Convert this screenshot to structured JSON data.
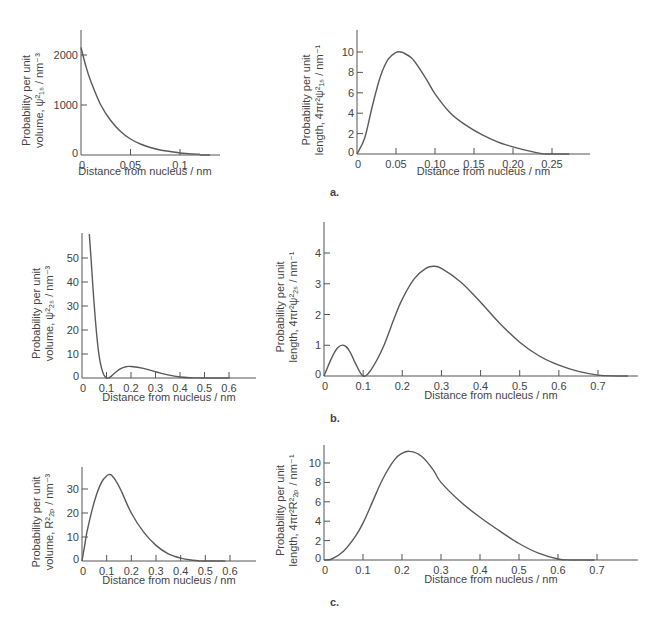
{
  "chart_data": [
    {
      "id": "a-left",
      "type": "line",
      "title": "",
      "xlabel": "Distance from nucleus / nm",
      "ylabel_line1": "Probability per unit",
      "ylabel_line2": "volume, ψ²₁ₛ / nm⁻³",
      "xlim": [
        0,
        0.13
      ],
      "ylim": [
        0,
        2500
      ],
      "xticks": [
        0,
        0.05,
        0.1
      ],
      "xtick_labels": [
        "0",
        "0.05",
        "0.1"
      ],
      "yticks": [
        0,
        1000,
        2000
      ],
      "ytick_labels": [
        "0",
        "1000",
        "2000"
      ],
      "x": [
        0,
        0.005,
        0.01,
        0.02,
        0.03,
        0.04,
        0.05,
        0.06,
        0.07,
        0.08,
        0.09,
        0.1,
        0.11,
        0.12
      ],
      "values": [
        2150,
        1770,
        1470,
        1000,
        690,
        470,
        320,
        220,
        150,
        100,
        70,
        40,
        25,
        15
      ]
    },
    {
      "id": "a-right",
      "type": "line",
      "title": "",
      "xlabel": "Distance from nucleus / nm",
      "ylabel_line1": "Probability per unit",
      "ylabel_line2": "length, 4πr²ψ²₁ₛ / nm⁻¹",
      "xlim": [
        0,
        0.28
      ],
      "ylim": [
        0,
        12
      ],
      "xticks": [
        0,
        0.05,
        0.1,
        0.15,
        0.2,
        0.25
      ],
      "xtick_labels": [
        "0",
        "0.05",
        "0.10",
        "0.15",
        "0.20",
        "0.25"
      ],
      "yticks": [
        0,
        2,
        4,
        6,
        8,
        10
      ],
      "ytick_labels": [
        "0",
        "2",
        "4",
        "6",
        "8",
        "10"
      ],
      "x": [
        0,
        0.01,
        0.02,
        0.03,
        0.04,
        0.05,
        0.055,
        0.06,
        0.07,
        0.08,
        0.09,
        0.1,
        0.12,
        0.14,
        0.16,
        0.18,
        0.2,
        0.22,
        0.24
      ],
      "values": [
        0,
        1.6,
        4.8,
        7.6,
        9.3,
        9.95,
        10.0,
        9.9,
        9.4,
        8.4,
        7.2,
        5.9,
        4.0,
        2.8,
        1.9,
        1.2,
        0.7,
        0.3,
        0.0
      ]
    },
    {
      "id": "b-left",
      "type": "line",
      "title": "",
      "xlabel": "Distance from nucleus / nm",
      "ylabel_line1": "Probability per unit",
      "ylabel_line2": "volume, ψ²₂ₛ / nm⁻³",
      "xlim": [
        0,
        0.7
      ],
      "ylim": [
        0,
        60
      ],
      "xticks": [
        0,
        0.1,
        0.2,
        0.3,
        0.4,
        0.5,
        0.6
      ],
      "xtick_labels": [
        "0",
        "0.1",
        "0.2",
        "0.3",
        "0.4",
        "0.5",
        "0.6"
      ],
      "yticks": [
        0,
        10,
        20,
        30,
        40,
        50
      ],
      "ytick_labels": [
        "0",
        "10",
        "20",
        "30",
        "40",
        "50"
      ],
      "x": [
        0.03,
        0.04,
        0.05,
        0.06,
        0.07,
        0.08,
        0.09,
        0.1,
        0.11,
        0.12,
        0.14,
        0.16,
        0.18,
        0.2,
        0.25,
        0.3,
        0.35,
        0.4,
        0.45,
        0.5
      ],
      "values": [
        60,
        45,
        30,
        18,
        9,
        4,
        1.2,
        0,
        0.1,
        0.8,
        2.6,
        4.0,
        4.7,
        4.8,
        4.0,
        2.6,
        1.3,
        0.4,
        0.1,
        0
      ]
    },
    {
      "id": "b-right",
      "type": "line",
      "title": "",
      "xlabel": "Distance from nucleus / nm",
      "ylabel_line1": "Probability per unit",
      "ylabel_line2": "length, 4πr²ψ²₂ₛ / nm⁻¹",
      "xlim": [
        0,
        0.8
      ],
      "ylim": [
        0,
        5
      ],
      "xticks": [
        0,
        0.1,
        0.2,
        0.3,
        0.4,
        0.5,
        0.6,
        0.7
      ],
      "xtick_labels": [
        "0",
        "0.1",
        "0.2",
        "0.3",
        "0.4",
        "0.5",
        "0.6",
        "0.7"
      ],
      "yticks": [
        0,
        1,
        2,
        3,
        4
      ],
      "ytick_labels": [
        "0",
        "1",
        "2",
        "3",
        "4"
      ],
      "x": [
        0,
        0.02,
        0.035,
        0.05,
        0.065,
        0.08,
        0.1,
        0.12,
        0.15,
        0.18,
        0.2,
        0.23,
        0.26,
        0.28,
        0.3,
        0.35,
        0.4,
        0.45,
        0.5,
        0.55,
        0.6,
        0.65,
        0.7,
        0.75
      ],
      "values": [
        0,
        0.6,
        0.92,
        1.0,
        0.82,
        0.42,
        0,
        0.2,
        0.9,
        1.9,
        2.5,
        3.15,
        3.5,
        3.57,
        3.5,
        3.05,
        2.4,
        1.7,
        1.1,
        0.65,
        0.35,
        0.15,
        0.03,
        0
      ]
    },
    {
      "id": "c-left",
      "type": "line",
      "title": "",
      "xlabel": "Distance from nucleus / nm",
      "ylabel_line1": "Probability per unit",
      "ylabel_line2": "volume, R²₂ₚ / nm⁻³",
      "xlim": [
        0,
        0.7
      ],
      "ylim": [
        0,
        40
      ],
      "xticks": [
        0,
        0.1,
        0.2,
        0.3,
        0.4,
        0.5,
        0.6
      ],
      "xtick_labels": [
        "0",
        "0.1",
        "0.2",
        "0.3",
        "0.4",
        "0.5",
        "0.6"
      ],
      "yticks": [
        0,
        10,
        20,
        30
      ],
      "ytick_labels": [
        "0",
        "10",
        "20",
        "30"
      ],
      "x": [
        0,
        0.01,
        0.02,
        0.04,
        0.06,
        0.08,
        0.1,
        0.11,
        0.12,
        0.14,
        0.16,
        0.2,
        0.25,
        0.3,
        0.35,
        0.4,
        0.45,
        0.48
      ],
      "values": [
        0,
        6,
        12,
        21,
        28,
        33,
        35.5,
        36,
        35.7,
        33,
        29,
        20,
        12,
        6.5,
        3,
        1.2,
        0.3,
        0
      ]
    },
    {
      "id": "c-right",
      "type": "line",
      "title": "",
      "xlabel": "Distance from nucleus / nm",
      "ylabel_line1": "Probability per unit",
      "ylabel_line2": "length, 4πr²R²₂ₚ / nm⁻¹",
      "xlim": [
        0,
        0.8
      ],
      "ylim": [
        0,
        12
      ],
      "xticks": [
        0,
        0.1,
        0.2,
        0.3,
        0.4,
        0.5,
        0.6,
        0.7
      ],
      "xtick_labels": [
        "0",
        "0.1",
        "0.2",
        "0.3",
        "0.4",
        "0.5",
        "0.6",
        "0.7"
      ],
      "yticks": [
        0,
        2,
        4,
        6,
        8,
        10
      ],
      "ytick_labels": [
        "0",
        "2",
        "4",
        "6",
        "8",
        "10"
      ],
      "x": [
        0,
        0.02,
        0.05,
        0.08,
        0.1,
        0.12,
        0.15,
        0.18,
        0.2,
        0.22,
        0.25,
        0.28,
        0.3,
        0.35,
        0.4,
        0.45,
        0.5,
        0.55,
        0.6,
        0.63
      ],
      "values": [
        0,
        0.1,
        0.9,
        2.4,
        3.8,
        5.6,
        8.3,
        10.3,
        11.0,
        11.2,
        10.7,
        9.3,
        8.0,
        6.0,
        4.4,
        3.0,
        1.7,
        0.7,
        0.1,
        0
      ]
    }
  ],
  "panel_labels": {
    "a": "a.",
    "b": "b.",
    "c": "c."
  }
}
